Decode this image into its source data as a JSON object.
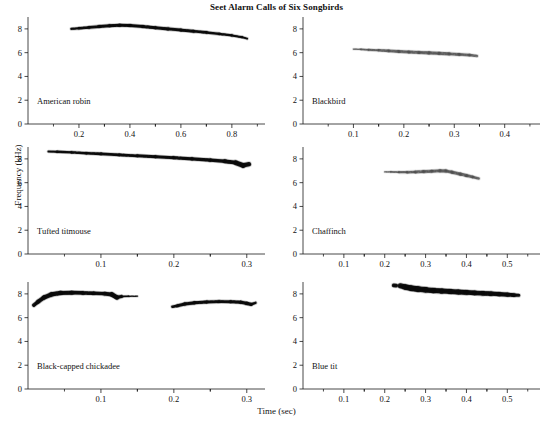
{
  "figure": {
    "title": "Seet Alarm Calls of Six Songbirds",
    "xlabel": "Time (sec)",
    "ylabel": "Frequency (kHz)"
  },
  "chart_data": {
    "type": "line",
    "title": "Seet Alarm Calls of Six Songbirds",
    "xlabel": "Time (sec)",
    "ylabel": "Frequency (kHz)",
    "grid": false,
    "legend": "none",
    "panel_layout": "3 rows x 2 columns",
    "shared_ylim": [
      0,
      9
    ],
    "shared_yticks": [
      0,
      2,
      4,
      6,
      8
    ],
    "panels": [
      {
        "name": "American robin",
        "row": 0,
        "col": 0,
        "xlim": [
          0.0,
          0.93
        ],
        "xticks": [
          0.2,
          0.4,
          0.6,
          0.8
        ],
        "ylim": [
          0,
          9
        ],
        "yticks": [
          0,
          2,
          4,
          6,
          8
        ],
        "trace_color": "#0a0a0a",
        "intensity": "dark",
        "segments": [
          {
            "x": [
              0.17,
              0.2,
              0.24,
              0.28,
              0.32,
              0.36,
              0.4,
              0.45,
              0.5,
              0.55,
              0.6,
              0.65,
              0.7,
              0.75,
              0.8,
              0.84,
              0.86
            ],
            "y": [
              8.0,
              8.05,
              8.12,
              8.2,
              8.26,
              8.3,
              8.28,
              8.2,
              8.1,
              8.0,
              7.9,
              7.8,
              7.7,
              7.58,
              7.45,
              7.3,
              7.18
            ],
            "width": [
              2.0,
              2.3,
              2.6,
              2.9,
              3.0,
              3.0,
              3.0,
              3.0,
              3.0,
              3.0,
              2.9,
              2.8,
              2.6,
              2.4,
              2.2,
              2.0,
              1.6
            ]
          }
        ]
      },
      {
        "name": "Blackbird",
        "row": 0,
        "col": 1,
        "xlim": [
          0.0,
          0.47
        ],
        "xticks": [
          0.1,
          0.2,
          0.3,
          0.4
        ],
        "ylim": [
          0,
          9
        ],
        "yticks": [
          0,
          2,
          4,
          6,
          8
        ],
        "trace_color": "#4d4d4d",
        "intensity": "medium",
        "segments": [
          {
            "x": [
              0.1,
              0.115,
              0.13,
              0.15,
              0.17,
              0.19,
              0.21,
              0.23,
              0.25,
              0.27,
              0.29,
              0.31,
              0.33,
              0.345
            ],
            "y": [
              6.3,
              6.28,
              6.24,
              6.2,
              6.15,
              6.1,
              6.06,
              6.02,
              5.98,
              5.94,
              5.9,
              5.85,
              5.8,
              5.72
            ],
            "width": [
              1.1,
              1.4,
              1.9,
              2.4,
              2.7,
              2.9,
              3.0,
              3.1,
              3.1,
              3.1,
              3.0,
              2.9,
              2.7,
              2.2
            ]
          }
        ]
      },
      {
        "name": "Tufted titmouse",
        "row": 1,
        "col": 0,
        "xlim": [
          0.0,
          0.325
        ],
        "xticks": [
          0.1,
          0.2,
          0.3
        ],
        "ylim": [
          0,
          9
        ],
        "yticks": [
          0,
          2,
          4,
          6,
          8
        ],
        "trace_color": "#0a0a0a",
        "intensity": "dark",
        "segments": [
          {
            "x": [
              0.028,
              0.04,
              0.06,
              0.08,
              0.1,
              0.125,
              0.15,
              0.175,
              0.2,
              0.225,
              0.25,
              0.27,
              0.285,
              0.295,
              0.303
            ],
            "y": [
              8.62,
              8.6,
              8.55,
              8.48,
              8.42,
              8.34,
              8.26,
              8.18,
              8.1,
              8.0,
              7.9,
              7.8,
              7.68,
              7.45,
              7.55
            ],
            "width": [
              1.9,
              2.2,
              2.4,
              2.5,
              2.6,
              2.7,
              2.8,
              2.9,
              3.0,
              3.1,
              3.2,
              3.4,
              4.2,
              5.5,
              3.2
            ]
          }
        ]
      },
      {
        "name": "Chaffinch",
        "row": 1,
        "col": 1,
        "xlim": [
          0.0,
          0.58
        ],
        "xticks": [
          0.1,
          0.2,
          0.3,
          0.4,
          0.5
        ],
        "ylim": [
          0,
          9
        ],
        "yticks": [
          0,
          2,
          4,
          6,
          8
        ],
        "trace_color": "#4d4d4d",
        "intensity": "medium",
        "segments": [
          {
            "x": [
              0.2,
              0.215,
              0.235,
              0.255,
              0.275,
              0.295,
              0.315,
              0.335,
              0.35,
              0.365,
              0.385,
              0.4,
              0.415,
              0.43
            ],
            "y": [
              6.9,
              6.9,
              6.88,
              6.88,
              6.9,
              6.93,
              6.96,
              7.0,
              6.98,
              6.88,
              6.72,
              6.6,
              6.48,
              6.35
            ],
            "width": [
              1.0,
              1.4,
              2.0,
              2.5,
              2.8,
              3.0,
              3.1,
              3.2,
              3.2,
              3.2,
              3.1,
              3.0,
              2.8,
              2.2
            ]
          }
        ]
      },
      {
        "name": "Black-capped chickadee",
        "row": 2,
        "col": 0,
        "xlim": [
          0.0,
          0.325
        ],
        "xticks": [
          0.1,
          0.2,
          0.3
        ],
        "ylim": [
          0,
          9
        ],
        "yticks": [
          0,
          2,
          4,
          6,
          8
        ],
        "trace_color": "#0a0a0a",
        "intensity": "dark",
        "segments": [
          {
            "x": [
              0.008,
              0.014,
              0.022,
              0.032,
              0.045,
              0.06,
              0.075,
              0.09,
              0.105,
              0.115,
              0.122,
              0.128,
              0.138,
              0.15
            ],
            "y": [
              7.05,
              7.35,
              7.7,
              7.95,
              8.08,
              8.1,
              8.08,
              8.05,
              8.02,
              7.95,
              7.7,
              7.78,
              7.8,
              7.8
            ],
            "width": [
              3.2,
              3.8,
              4.2,
              4.4,
              4.2,
              3.8,
              3.6,
              3.4,
              3.4,
              4.4,
              4.6,
              2.0,
              1.2,
              0.8
            ]
          },
          {
            "x": [
              0.198,
              0.205,
              0.215,
              0.228,
              0.245,
              0.262,
              0.278,
              0.292,
              0.3,
              0.306,
              0.312
            ],
            "y": [
              6.92,
              7.0,
              7.15,
              7.25,
              7.32,
              7.35,
              7.34,
              7.3,
              7.2,
              7.12,
              7.25
            ],
            "width": [
              2.2,
              2.8,
              3.2,
              3.2,
              3.0,
              2.9,
              2.9,
              3.0,
              3.4,
              3.2,
              1.4
            ]
          }
        ]
      },
      {
        "name": "Blue tit",
        "row": 2,
        "col": 1,
        "xlim": [
          0.0,
          0.58
        ],
        "xticks": [
          0.1,
          0.2,
          0.3,
          0.4,
          0.5
        ],
        "ylim": [
          0,
          9
        ],
        "yticks": [
          0,
          2,
          4,
          6,
          8
        ],
        "trace_color": "#0a0a0a",
        "intensity": "dark",
        "segments": [
          {
            "x": [
              0.222,
              0.228
            ],
            "y": [
              8.72,
              8.7
            ],
            "width": [
              4.0,
              3.4
            ]
          },
          {
            "x": [
              0.238,
              0.25,
              0.265,
              0.282,
              0.3,
              0.32,
              0.34,
              0.36,
              0.38,
              0.4,
              0.42,
              0.44,
              0.46,
              0.48,
              0.5,
              0.516,
              0.528
            ],
            "y": [
              8.68,
              8.58,
              8.48,
              8.4,
              8.34,
              8.28,
              8.24,
              8.2,
              8.16,
              8.12,
              8.08,
              8.05,
              8.02,
              7.98,
              7.94,
              7.9,
              7.88
            ],
            "width": [
              4.8,
              5.4,
              5.6,
              5.6,
              5.4,
              5.2,
              5.0,
              5.0,
              4.8,
              4.8,
              4.6,
              4.6,
              4.4,
              4.4,
              4.2,
              3.6,
              2.6
            ]
          }
        ]
      }
    ]
  }
}
